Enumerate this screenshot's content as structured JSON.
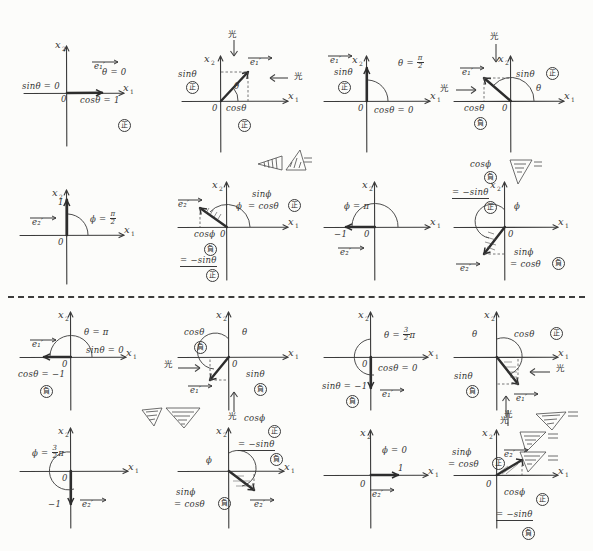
{
  "page": {
    "axis_x": "x",
    "axis_x_sub": "1",
    "axis_y": "x",
    "axis_y_sub": "2",
    "origin": "0",
    "kanji_positive": "正",
    "kanji_negative": "負",
    "kanji_light": "光",
    "ink_color": "#343434",
    "paper_color": "#fcfcfa"
  },
  "panels": [
    {
      "id": "p1",
      "row": 1,
      "col": 1,
      "angle_label": "θ = 0",
      "vector_label": "e₁′",
      "labels": [
        {
          "text": "sinθ = 0",
          "x": 4,
          "y": 52
        },
        {
          "text": "θ = 0",
          "x": 84,
          "y": 36
        },
        {
          "text": "cosθ = 1",
          "x": 66,
          "y": 64
        },
        {
          "text": "0",
          "x": 53,
          "y": 64
        }
      ],
      "sign_marks": [
        {
          "kanji": "正",
          "x": 100,
          "y": 86
        }
      ],
      "quadrant": 0
    },
    {
      "id": "p2",
      "row": 1,
      "col": 2,
      "angle_label": "θ",
      "vector_label": "e₁′",
      "labels": [
        {
          "text": "sinθ",
          "x": 4,
          "y": 40
        },
        {
          "text": "cosθ",
          "x": 52,
          "y": 64
        },
        {
          "text": "θ",
          "x": 62,
          "y": 46
        }
      ],
      "sign_marks": [
        {
          "kanji": "正",
          "x": 14,
          "y": 52
        },
        {
          "kanji": "正",
          "x": 66,
          "y": 84
        }
      ],
      "light_labels": [
        {
          "text": "光",
          "x": 52,
          "y": 2
        },
        {
          "text": "光",
          "x": 114,
          "y": 38
        }
      ],
      "quadrant": 1
    },
    {
      "id": "p3",
      "row": 1,
      "col": 3,
      "angle_label": "θ = π/2",
      "vector_label": "e₁′",
      "labels": [
        {
          "text": "sinθ",
          "x": 14,
          "y": 36
        },
        {
          "text": "cosθ = 0",
          "x": 56,
          "y": 64
        }
      ],
      "sign_marks": [
        {
          "kanji": "正",
          "x": 20,
          "y": 50
        }
      ],
      "quadrant": 90
    },
    {
      "id": "p4",
      "row": 1,
      "col": 4,
      "angle_label": "θ",
      "vector_label": "e₁′",
      "labels": [
        {
          "text": "sinθ",
          "x": 72,
          "y": 38
        },
        {
          "text": "cosθ",
          "x": 16,
          "y": 62
        },
        {
          "text": "θ",
          "x": 76,
          "y": 50
        }
      ],
      "sign_marks": [
        {
          "kanji": "正",
          "x": 100,
          "y": 36
        },
        {
          "kanji": "負",
          "x": 30,
          "y": 76
        }
      ],
      "light_labels": [
        {
          "text": "光",
          "x": 46,
          "y": 2
        },
        {
          "text": "光",
          "x": 2,
          "y": 48
        }
      ],
      "quadrant": 2
    },
    {
      "id": "p5",
      "row": 2,
      "col": 1,
      "angle_label": "ϕ = π/2",
      "vector_label": "e₂′",
      "labels": [
        {
          "text": "1",
          "x": 46,
          "y": 24
        },
        {
          "text": "0",
          "x": 46,
          "y": 64
        }
      ],
      "sign_marks": [],
      "quadrant": 90
    },
    {
      "id": "p6",
      "row": 2,
      "col": 2,
      "angle_label": "ϕ",
      "vector_label": "e₂′",
      "labels": [
        {
          "text": "sinϕ",
          "x": 78,
          "y": 26
        },
        {
          "text": "= cosθ",
          "x": 74,
          "y": 36
        },
        {
          "text": "cosϕ",
          "x": 18,
          "y": 62
        },
        {
          "text": "0",
          "x": 48,
          "y": 62
        },
        {
          "text": "= −sinθ",
          "x": 6,
          "y": 94
        },
        {
          "text": "ϕ",
          "x": 58,
          "y": 38
        }
      ],
      "sign_marks": [
        {
          "kanji": "正",
          "x": 112,
          "y": 34
        },
        {
          "kanji": "負",
          "x": 30,
          "y": 76
        },
        {
          "kanji": "正",
          "x": 34,
          "y": 108
        }
      ],
      "quadrant": 2
    },
    {
      "id": "p7",
      "row": 2,
      "col": 3,
      "angle_label": "ϕ = π",
      "vector_label": "e₂′",
      "labels": [
        {
          "text": "ϕ = π",
          "x": 24,
          "y": 34
        },
        {
          "text": "−1",
          "x": 14,
          "y": 62
        },
        {
          "text": "0",
          "x": 44,
          "y": 62
        }
      ],
      "sign_marks": [],
      "quadrant": 180
    },
    {
      "id": "p8",
      "row": 2,
      "col": 4,
      "angle_label": "ϕ",
      "vector_label": "e₂′",
      "labels": [
        {
          "text": "cosϕ",
          "x": 24,
          "y": 2
        },
        {
          "text": "= −sinθ",
          "x": 4,
          "y": 30
        },
        {
          "text": "sinϕ",
          "x": 70,
          "y": 82
        },
        {
          "text": "= cosθ",
          "x": 66,
          "y": 92
        },
        {
          "text": "0",
          "x": 58,
          "y": 62
        },
        {
          "text": "ϕ",
          "x": 58,
          "y": 38
        }
      ],
      "sign_marks": [
        {
          "kanji": "負",
          "x": 36,
          "y": 16
        },
        {
          "kanji": "正",
          "x": 38,
          "y": 44
        },
        {
          "kanji": "負",
          "x": 106,
          "y": 90
        }
      ],
      "quadrant": 3
    },
    {
      "id": "p9",
      "row": 3,
      "col": 1,
      "angle_label": "θ = π",
      "vector_label": "e₁′",
      "labels": [
        {
          "text": "θ = π",
          "x": 68,
          "y": 24
        },
        {
          "text": "sinθ = 0",
          "x": 70,
          "y": 40
        },
        {
          "text": "cosθ = −1",
          "x": 0,
          "y": 66
        },
        {
          "text": "0",
          "x": 48,
          "y": 58
        }
      ],
      "sign_marks": [
        {
          "kanji": "負",
          "x": 24,
          "y": 80
        }
      ],
      "quadrant": 180
    },
    {
      "id": "p10",
      "row": 3,
      "col": 2,
      "angle_label": "θ",
      "vector_label": "e₁′",
      "labels": [
        {
          "text": "cosθ",
          "x": 10,
          "y": 26
        },
        {
          "text": "sinθ",
          "x": 74,
          "y": 66
        },
        {
          "text": "0",
          "x": 56,
          "y": 52
        },
        {
          "text": "θ",
          "x": 68,
          "y": 26
        }
      ],
      "sign_marks": [
        {
          "kanji": "負",
          "x": 24,
          "y": 40
        },
        {
          "kanji": "負",
          "x": 84,
          "y": 80
        }
      ],
      "light_labels": [
        {
          "text": "光",
          "x": 0,
          "y": 54
        },
        {
          "text": "光",
          "x": 52,
          "y": 104
        }
      ],
      "quadrant": 3
    },
    {
      "id": "p11",
      "row": 3,
      "col": 3,
      "angle_label": "θ = 3π/2",
      "vector_label": "e₁′",
      "labels": [
        {
          "text": "cosθ = 0",
          "x": 60,
          "y": 60
        },
        {
          "text": "sinθ = −1",
          "x": 0,
          "y": 78
        },
        {
          "text": "0",
          "x": 50,
          "y": 54
        }
      ],
      "sign_marks": [
        {
          "kanji": "負",
          "x": 26,
          "y": 92
        }
      ],
      "quadrant": 270
    },
    {
      "id": "p12",
      "row": 3,
      "col": 4,
      "angle_label": "θ",
      "vector_label": "e₁′",
      "labels": [
        {
          "text": "cosθ",
          "x": 70,
          "y": 26
        },
        {
          "text": "sinθ",
          "x": 6,
          "y": 66
        },
        {
          "text": "θ",
          "x": 26,
          "y": 28
        }
      ],
      "sign_marks": [
        {
          "kanji": "正",
          "x": 104,
          "y": 26
        },
        {
          "kanji": "負",
          "x": 20,
          "y": 80
        }
      ],
      "light_labels": [
        {
          "text": "光",
          "x": 108,
          "y": 58
        },
        {
          "text": "光",
          "x": 58,
          "y": 104
        }
      ],
      "quadrant": 4
    },
    {
      "id": "p13",
      "row": 4,
      "col": 1,
      "angle_label": "ϕ = 3π/2",
      "vector_label": "e₂′",
      "labels": [
        {
          "text": "0",
          "x": 48,
          "y": 58
        },
        {
          "text": "−1",
          "x": 32,
          "y": 82
        }
      ],
      "sign_marks": [],
      "quadrant": 270
    },
    {
      "id": "p14",
      "row": 4,
      "col": 2,
      "angle_label": "ϕ",
      "vector_label": "e₂′",
      "labels": [
        {
          "text": "cosϕ",
          "x": 74,
          "y": -6
        },
        {
          "text": "= −sinθ",
          "x": 66,
          "y": 20
        },
        {
          "text": "sinϕ",
          "x": 2,
          "y": 64
        },
        {
          "text": "= cosθ",
          "x": 0,
          "y": 76
        },
        {
          "text": "ϕ",
          "x": 34,
          "y": 36
        }
      ],
      "sign_marks": [
        {
          "kanji": "正",
          "x": 96,
          "y": 8
        },
        {
          "kanji": "負",
          "x": 98,
          "y": 34
        },
        {
          "kanji": "負",
          "x": 46,
          "y": 76
        }
      ],
      "quadrant": 4
    },
    {
      "id": "p15",
      "row": 4,
      "col": 3,
      "angle_label": "ϕ = 0",
      "vector_label": "e₂′",
      "labels": [
        {
          "text": "ϕ = 0",
          "x": 62,
          "y": 26
        },
        {
          "text": "1",
          "x": 82,
          "y": 46
        },
        {
          "text": "0",
          "x": 44,
          "y": 64
        }
      ],
      "sign_marks": [],
      "quadrant": 0
    },
    {
      "id": "p16",
      "row": 4,
      "col": 4,
      "angle_label": "ϕ",
      "vector_label": "e₂′",
      "labels": [
        {
          "text": "sinϕ",
          "x": 2,
          "y": 26
        },
        {
          "text": "= cosθ",
          "x": 0,
          "y": 38
        },
        {
          "text": "cosϕ",
          "x": 56,
          "y": 66
        },
        {
          "text": "= −sinθ",
          "x": 48,
          "y": 88
        },
        {
          "text": "0",
          "x": 36,
          "y": 62
        }
      ],
      "sign_marks": [
        {
          "kanji": "正",
          "x": 44,
          "y": 36
        },
        {
          "kanji": "正",
          "x": 86,
          "y": 72
        },
        {
          "kanji": "負",
          "x": 74,
          "y": 106
        }
      ],
      "light_labels": [
        {
          "text": "光",
          "x": 58,
          "y": -10
        }
      ],
      "quadrant": 1
    }
  ]
}
